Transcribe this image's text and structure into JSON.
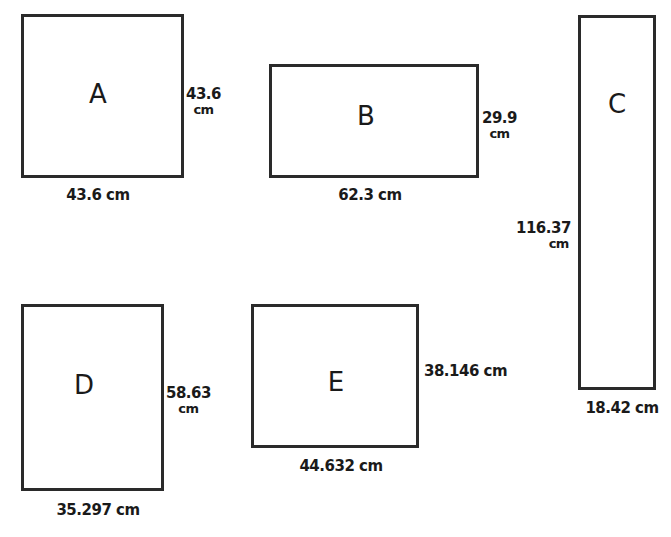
{
  "colors": {
    "stroke": "#2a2a2a",
    "background": "#ffffff",
    "text": "#1a1a1a"
  },
  "shapes": [
    {
      "label": "A",
      "width_label": "43.6 cm",
      "height_value": "43.6",
      "height_unit": "cm"
    },
    {
      "label": "B",
      "width_label": "62.3 cm",
      "height_value": "29.9",
      "height_unit": "cm"
    },
    {
      "label": "C",
      "width_label": "18.42 cm",
      "height_value": "116.37",
      "height_unit": "cm"
    },
    {
      "label": "D",
      "width_label": "35.297 cm",
      "height_value": "58.63",
      "height_unit": "cm"
    },
    {
      "label": "E",
      "width_label": "44.632 cm",
      "height_label": "38.146 cm"
    }
  ]
}
